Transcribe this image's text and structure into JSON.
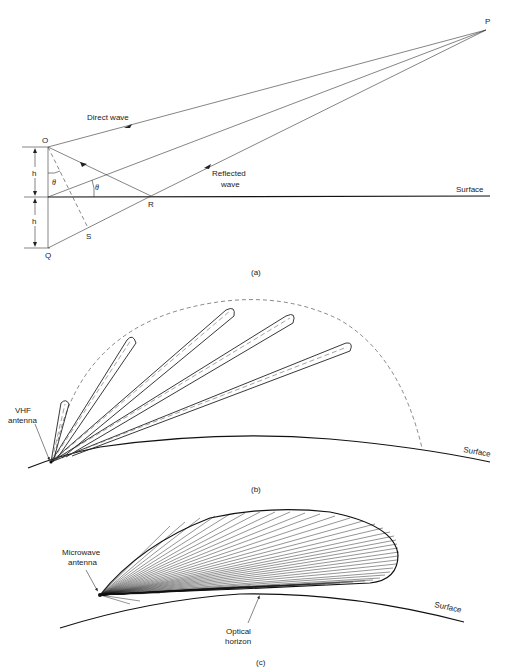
{
  "figure": {
    "panel_a": {
      "points": {
        "P": "P",
        "O": "O",
        "R": "R",
        "S": "S",
        "Q": "Q"
      },
      "labels": {
        "direct_wave": "Direct wave",
        "reflected_wave_line1": "Reflected",
        "reflected_wave_line2": "wave",
        "surface": "Surface",
        "height_upper": "h",
        "height_lower": "h",
        "angle_at_O": "θ",
        "angle_at_surface": "θ"
      },
      "caption": "(a)"
    },
    "panel_b": {
      "labels": {
        "antenna_line1": "VHF",
        "antenna_line2": "antenna",
        "surface": "Surface"
      },
      "caption": "(b)"
    },
    "panel_c": {
      "labels": {
        "antenna_line1": "Microwave",
        "antenna_line2": "antenna",
        "horizon_line1": "Optical",
        "horizon_line2": "horizon",
        "surface": "Surface"
      },
      "caption": "(c)"
    }
  }
}
